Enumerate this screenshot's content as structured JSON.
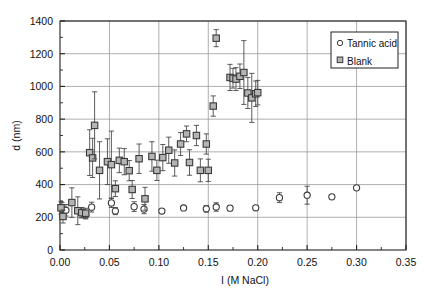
{
  "chart_data": {
    "type": "scatter",
    "title": "",
    "xlabel": "I (M NaCl)",
    "ylabel": "d (nm)",
    "xlim": [
      0.0,
      0.35
    ],
    "ylim": [
      0,
      1400
    ],
    "xticks": [
      "0.00",
      "0.05",
      "0.10",
      "0.15",
      "0.20",
      "0.25",
      "0.30",
      "0.35"
    ],
    "xtick_values": [
      0.0,
      0.05,
      0.1,
      0.15,
      0.2,
      0.25,
      0.3,
      0.35
    ],
    "yticks": [
      "0",
      "200",
      "400",
      "600",
      "800",
      "1000",
      "1200",
      "1400"
    ],
    "ytick_values": [
      0,
      200,
      400,
      600,
      800,
      1000,
      1200,
      1400
    ],
    "grid": true,
    "grid_color": "#9a9a9a",
    "legend_position": "upper-right",
    "marker_fill": "#b4b4b4",
    "marker_edge": "#3a3a3a",
    "series": [
      {
        "name": "Tannic acid",
        "marker": "circle-open",
        "points": [
          {
            "x": 0.002,
            "y": 250,
            "err": 40
          },
          {
            "x": 0.006,
            "y": 243,
            "err": 35
          },
          {
            "x": 0.022,
            "y": 228,
            "err": 30
          },
          {
            "x": 0.026,
            "y": 215,
            "err": 25
          },
          {
            "x": 0.032,
            "y": 262,
            "err": 30
          },
          {
            "x": 0.052,
            "y": 288,
            "err": 28
          },
          {
            "x": 0.056,
            "y": 238,
            "err": 22
          },
          {
            "x": 0.075,
            "y": 265,
            "err": 30
          },
          {
            "x": 0.085,
            "y": 250,
            "err": 28
          },
          {
            "x": 0.103,
            "y": 238,
            "err": 14
          },
          {
            "x": 0.125,
            "y": 257,
            "err": 14
          },
          {
            "x": 0.148,
            "y": 252,
            "err": 20
          },
          {
            "x": 0.158,
            "y": 263,
            "err": 26
          },
          {
            "x": 0.172,
            "y": 256,
            "err": 14
          },
          {
            "x": 0.198,
            "y": 258,
            "err": 14
          },
          {
            "x": 0.222,
            "y": 320,
            "err": 30
          },
          {
            "x": 0.25,
            "y": 335,
            "err": 55
          },
          {
            "x": 0.275,
            "y": 325,
            "err": 0
          },
          {
            "x": 0.3,
            "y": 380,
            "err": 0
          }
        ]
      },
      {
        "name": "Blank",
        "marker": "square-filled",
        "points": [
          {
            "x": 0.001,
            "y": 258,
            "err": 38
          },
          {
            "x": 0.003,
            "y": 205,
            "err": 40
          },
          {
            "x": 0.012,
            "y": 290,
            "err": 90
          },
          {
            "x": 0.018,
            "y": 240,
            "err": 85
          },
          {
            "x": 0.022,
            "y": 228,
            "err": 32
          },
          {
            "x": 0.026,
            "y": 225,
            "err": 30
          },
          {
            "x": 0.03,
            "y": 595,
            "err": 140
          },
          {
            "x": 0.033,
            "y": 563,
            "err": 120
          },
          {
            "x": 0.035,
            "y": 762,
            "err": 205
          },
          {
            "x": 0.04,
            "y": 487,
            "err": 175
          },
          {
            "x": 0.048,
            "y": 540,
            "err": 140
          },
          {
            "x": 0.052,
            "y": 522,
            "err": 205
          },
          {
            "x": 0.056,
            "y": 375,
            "err": 48
          },
          {
            "x": 0.06,
            "y": 548,
            "err": 75
          },
          {
            "x": 0.065,
            "y": 540,
            "err": 80
          },
          {
            "x": 0.07,
            "y": 485,
            "err": 62
          },
          {
            "x": 0.073,
            "y": 370,
            "err": 55
          },
          {
            "x": 0.08,
            "y": 558,
            "err": 90
          },
          {
            "x": 0.086,
            "y": 313,
            "err": 70
          },
          {
            "x": 0.093,
            "y": 572,
            "err": 90
          },
          {
            "x": 0.098,
            "y": 487,
            "err": 62
          },
          {
            "x": 0.104,
            "y": 565,
            "err": 80
          },
          {
            "x": 0.11,
            "y": 610,
            "err": 80
          },
          {
            "x": 0.116,
            "y": 532,
            "err": 80
          },
          {
            "x": 0.122,
            "y": 648,
            "err": 70
          },
          {
            "x": 0.128,
            "y": 710,
            "err": 48
          },
          {
            "x": 0.131,
            "y": 535,
            "err": 78
          },
          {
            "x": 0.138,
            "y": 700,
            "err": 62
          },
          {
            "x": 0.142,
            "y": 487,
            "err": 70
          },
          {
            "x": 0.148,
            "y": 648,
            "err": 62
          },
          {
            "x": 0.15,
            "y": 487,
            "err": 68
          },
          {
            "x": 0.155,
            "y": 880,
            "err": 62
          },
          {
            "x": 0.158,
            "y": 1295,
            "err": 52
          },
          {
            "x": 0.172,
            "y": 1055,
            "err": 80
          },
          {
            "x": 0.175,
            "y": 1050,
            "err": 60
          },
          {
            "x": 0.178,
            "y": 1045,
            "err": 70
          },
          {
            "x": 0.182,
            "y": 1062,
            "err": 75
          },
          {
            "x": 0.186,
            "y": 1085,
            "err": 195
          },
          {
            "x": 0.19,
            "y": 960,
            "err": 95
          },
          {
            "x": 0.194,
            "y": 930,
            "err": 150
          },
          {
            "x": 0.198,
            "y": 955,
            "err": 78
          },
          {
            "x": 0.2,
            "y": 962,
            "err": 75
          }
        ]
      }
    ]
  }
}
